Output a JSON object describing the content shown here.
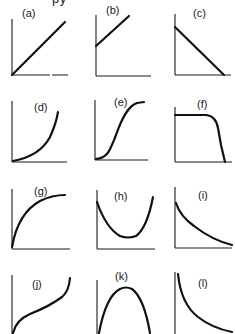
{
  "header": {
    "cutoff_text": "py"
  },
  "colors": {
    "background": "#ffffff",
    "line": "#111111",
    "axis": "#1a1a1a"
  },
  "panels": [
    {
      "id": "a",
      "label": "(a)",
      "shape": "linear increasing through origin"
    },
    {
      "id": "b",
      "label": "(b)",
      "shape": "linear increasing with positive intercept"
    },
    {
      "id": "c",
      "label": "(c)",
      "shape": "linear decreasing"
    },
    {
      "id": "d",
      "label": "(d)",
      "shape": "increasing, concave up (exponential-like)"
    },
    {
      "id": "e",
      "label": "(e)",
      "shape": "sigmoid / S-curve"
    },
    {
      "id": "f",
      "label": "(f)",
      "shape": "flat then sharp drop"
    },
    {
      "id": "g",
      "label": "(g)",
      "shape": "increasing, concave down (saturating)"
    },
    {
      "id": "h",
      "label": "(h)",
      "shape": "U-shaped (minimum)"
    },
    {
      "id": "i",
      "label": "(i)",
      "shape": "decreasing, concave up (decay)"
    },
    {
      "id": "j",
      "label": "(j)",
      "shape": "rise, plateau slope, rise (inverse sigmoid)"
    },
    {
      "id": "k",
      "label": "(k)",
      "shape": "inverted U (maximum)"
    },
    {
      "id": "l",
      "label": "(l)",
      "shape": "hyperbolic decay (1/x)"
    }
  ]
}
